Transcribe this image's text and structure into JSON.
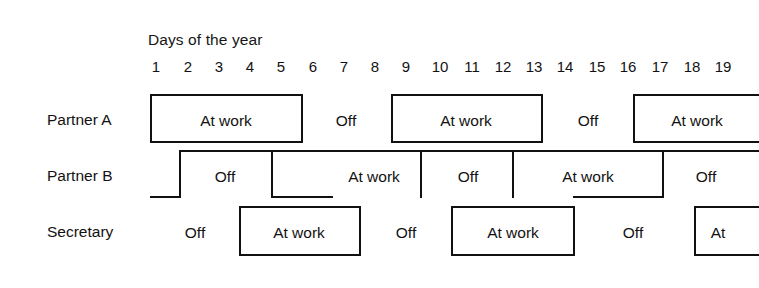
{
  "chart_data": {
    "type": "table",
    "title": "Days of the year",
    "xlabel": "Days of the year",
    "ylabel": "",
    "x_tick_labels": [
      "1",
      "2",
      "3",
      "4",
      "5",
      "6",
      "7",
      "8",
      "9",
      "10",
      "11",
      "12",
      "13",
      "14",
      "15",
      "16",
      "17",
      "18",
      "19"
    ],
    "x_range": [
      1,
      19
    ],
    "grid": false,
    "legend": "none",
    "row_labels": [
      "Partner A",
      "Partner B",
      "Secretary"
    ],
    "state_labels": [
      "At work",
      "Off"
    ],
    "series": [
      {
        "name": "Partner A",
        "segments": [
          {
            "label": "At work",
            "start_day": 1,
            "end_day": 5,
            "boxed": true
          },
          {
            "label": "Off",
            "start_day": 5,
            "end_day": 8,
            "boxed": false
          },
          {
            "label": "At work",
            "start_day": 8,
            "end_day": 13,
            "boxed": true
          },
          {
            "label": "Off",
            "start_day": 13,
            "end_day": 16,
            "boxed": false
          },
          {
            "label": "At work",
            "start_day": 16,
            "end_day": 19,
            "boxed": true
          }
        ]
      },
      {
        "name": "Partner B",
        "segments": [
          {
            "label": "Off",
            "start_day": 1,
            "end_day": 4,
            "boxed": false
          },
          {
            "label": "At work",
            "start_day": 4,
            "end_day": 9,
            "boxed": true
          },
          {
            "label": "Off",
            "start_day": 9,
            "end_day": 11,
            "boxed": false
          },
          {
            "label": "At work",
            "start_day": 11,
            "end_day": 16,
            "boxed": true
          },
          {
            "label": "Off",
            "start_day": 16,
            "end_day": 19,
            "boxed": false
          }
        ]
      },
      {
        "name": "Secretary",
        "segments": [
          {
            "label": "Off",
            "start_day": 1,
            "end_day": 3,
            "boxed": false
          },
          {
            "label": "At work",
            "start_day": 3,
            "end_day": 7,
            "boxed": true
          },
          {
            "label": "Off",
            "start_day": 7,
            "end_day": 10,
            "boxed": false
          },
          {
            "label": "At work",
            "start_day": 10,
            "end_day": 14,
            "boxed": true
          },
          {
            "label": "Off",
            "start_day": 14,
            "end_day": 18,
            "boxed": false
          },
          {
            "label": "At",
            "start_day": 18,
            "end_day": 19,
            "boxed": true
          }
        ]
      }
    ]
  },
  "header": {
    "title": "Days of the year"
  },
  "axis": {
    "ticks": [
      {
        "label": "1",
        "x": 156
      },
      {
        "label": "2",
        "x": 188
      },
      {
        "label": "3",
        "x": 219
      },
      {
        "label": "4",
        "x": 250
      },
      {
        "label": "5",
        "x": 281
      },
      {
        "label": "6",
        "x": 313
      },
      {
        "label": "7",
        "x": 344
      },
      {
        "label": "8",
        "x": 375
      },
      {
        "label": "9",
        "x": 406
      },
      {
        "label": "10",
        "x": 440
      },
      {
        "label": "11",
        "x": 472
      },
      {
        "label": "12",
        "x": 503
      },
      {
        "label": "13",
        "x": 534
      },
      {
        "label": "14",
        "x": 565
      },
      {
        "label": "15",
        "x": 597
      },
      {
        "label": "16",
        "x": 628
      },
      {
        "label": "17",
        "x": 660
      },
      {
        "label": "18",
        "x": 692
      },
      {
        "label": "19",
        "x": 723
      }
    ]
  },
  "rows": [
    {
      "label": "Partner A",
      "x": 47,
      "y": 111
    },
    {
      "label": "Partner B",
      "x": 47,
      "y": 167
    },
    {
      "label": "Secretary",
      "x": 47,
      "y": 223
    }
  ],
  "cells": [
    {
      "text": "At work",
      "x": 226,
      "y": 112,
      "row": "Partner A"
    },
    {
      "text": "Off",
      "x": 346,
      "y": 112,
      "row": "Partner A"
    },
    {
      "text": "At work",
      "x": 466,
      "y": 112,
      "row": "Partner A"
    },
    {
      "text": "Off",
      "x": 588,
      "y": 112,
      "row": "Partner A"
    },
    {
      "text": "At work",
      "x": 697,
      "y": 112,
      "row": "Partner A"
    },
    {
      "text": "Off",
      "x": 225,
      "y": 168,
      "row": "Partner B"
    },
    {
      "text": "At work",
      "x": 374,
      "y": 168,
      "row": "Partner B"
    },
    {
      "text": "Off",
      "x": 468,
      "y": 168,
      "row": "Partner B"
    },
    {
      "text": "At work",
      "x": 588,
      "y": 168,
      "row": "Partner B"
    },
    {
      "text": "Off",
      "x": 706,
      "y": 168,
      "row": "Partner B"
    },
    {
      "text": "Off",
      "x": 195,
      "y": 224,
      "row": "Secretary"
    },
    {
      "text": "At work",
      "x": 299,
      "y": 224,
      "row": "Secretary"
    },
    {
      "text": "Off",
      "x": 406,
      "y": 224,
      "row": "Secretary"
    },
    {
      "text": "At work",
      "x": 513,
      "y": 224,
      "row": "Secretary"
    },
    {
      "text": "Off",
      "x": 633,
      "y": 224,
      "row": "Secretary"
    },
    {
      "text": "At",
      "x": 718,
      "y": 224,
      "row": "Secretary"
    }
  ],
  "lines": {
    "partner_a": [
      {
        "o": "h",
        "x": 150,
        "y": 94,
        "len": 153
      },
      {
        "o": "v",
        "x": 150,
        "y": 94,
        "len": 48
      },
      {
        "o": "v",
        "x": 301,
        "y": 94,
        "len": 48
      },
      {
        "o": "h",
        "x": 150,
        "y": 141,
        "len": 153
      },
      {
        "o": "h",
        "x": 391,
        "y": 94,
        "len": 152
      },
      {
        "o": "v",
        "x": 391,
        "y": 94,
        "len": 48
      },
      {
        "o": "v",
        "x": 541,
        "y": 94,
        "len": 48
      },
      {
        "o": "h",
        "x": 391,
        "y": 141,
        "len": 152
      },
      {
        "o": "h",
        "x": 633,
        "y": 94,
        "len": 126
      },
      {
        "o": "v",
        "x": 633,
        "y": 94,
        "len": 48
      },
      {
        "o": "h",
        "x": 633,
        "y": 141,
        "len": 126
      }
    ],
    "partner_b": [
      {
        "o": "v",
        "x": 179,
        "y": 150,
        "len": 48
      },
      {
        "o": "h",
        "x": 150,
        "y": 196,
        "len": 31
      },
      {
        "o": "h",
        "x": 179,
        "y": 150,
        "len": 92
      },
      {
        "o": "v",
        "x": 271,
        "y": 150,
        "len": 48
      },
      {
        "o": "h",
        "x": 271,
        "y": 150,
        "len": 150
      },
      {
        "o": "h",
        "x": 271,
        "y": 196,
        "len": 62
      },
      {
        "o": "v",
        "x": 420,
        "y": 150,
        "len": 48
      },
      {
        "o": "h",
        "x": 420,
        "y": 150,
        "len": 92
      },
      {
        "o": "v",
        "x": 512,
        "y": 150,
        "len": 48
      },
      {
        "o": "h",
        "x": 512,
        "y": 150,
        "len": 151
      },
      {
        "o": "v",
        "x": 662,
        "y": 150,
        "len": 48
      },
      {
        "o": "h",
        "x": 573,
        "y": 196,
        "len": 90
      },
      {
        "o": "h",
        "x": 662,
        "y": 150,
        "len": 97
      }
    ],
    "secretary": [
      {
        "o": "h",
        "x": 239,
        "y": 206,
        "len": 122
      },
      {
        "o": "v",
        "x": 239,
        "y": 206,
        "len": 50
      },
      {
        "o": "v",
        "x": 359,
        "y": 206,
        "len": 50
      },
      {
        "o": "h",
        "x": 239,
        "y": 254,
        "len": 122
      },
      {
        "o": "h",
        "x": 451,
        "y": 206,
        "len": 124
      },
      {
        "o": "v",
        "x": 451,
        "y": 206,
        "len": 50
      },
      {
        "o": "v",
        "x": 573,
        "y": 206,
        "len": 50
      },
      {
        "o": "h",
        "x": 451,
        "y": 254,
        "len": 124
      },
      {
        "o": "h",
        "x": 694,
        "y": 206,
        "len": 65
      },
      {
        "o": "v",
        "x": 694,
        "y": 206,
        "len": 50
      },
      {
        "o": "h",
        "x": 694,
        "y": 254,
        "len": 65
      }
    ]
  },
  "colors": {
    "line": "#111111",
    "text": "#121212",
    "background": "#ffffff"
  }
}
